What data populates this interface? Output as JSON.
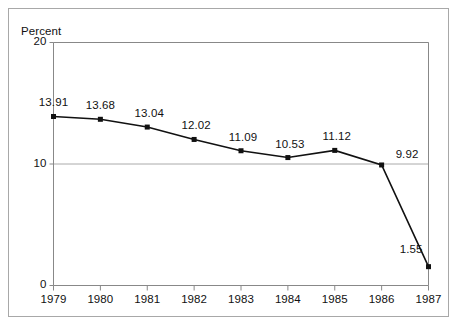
{
  "chart_data": {
    "type": "line",
    "title": "",
    "subtitle": "",
    "xlabel": "",
    "ylabel": "Percent",
    "categories": [
      "1979",
      "1980",
      "1981",
      "1982",
      "1983",
      "1984",
      "1985",
      "1986",
      "1987"
    ],
    "values": [
      13.91,
      13.68,
      13.04,
      12.02,
      11.09,
      10.53,
      11.12,
      9.92,
      1.55
    ],
    "point_labels": [
      "13.91",
      "13.68",
      "13.04",
      "12.02",
      "11.09",
      "10.53",
      "11.12",
      "9.92",
      "1.55"
    ],
    "ylim": [
      0,
      20
    ],
    "yticks": [
      0,
      10,
      20
    ],
    "ytick_labels": [
      "0",
      "10",
      "20"
    ],
    "xtick_labels": [
      "1979",
      "1980",
      "1981",
      "1982",
      "1983",
      "1984",
      "1985",
      "1986",
      "1987"
    ],
    "grid": true,
    "gridlines_y": [
      10,
      20
    ],
    "legend": null,
    "legend_position": "none",
    "marker": "square",
    "line_color": "#111111",
    "marker_color": "#111111",
    "grid_color": "#aaaaaa",
    "axis_color": "#888888",
    "frame_color": "#a8a8a8",
    "background": "#ffffff",
    "annotations": []
  },
  "labels": {
    "ylabel_title": "Percent"
  }
}
